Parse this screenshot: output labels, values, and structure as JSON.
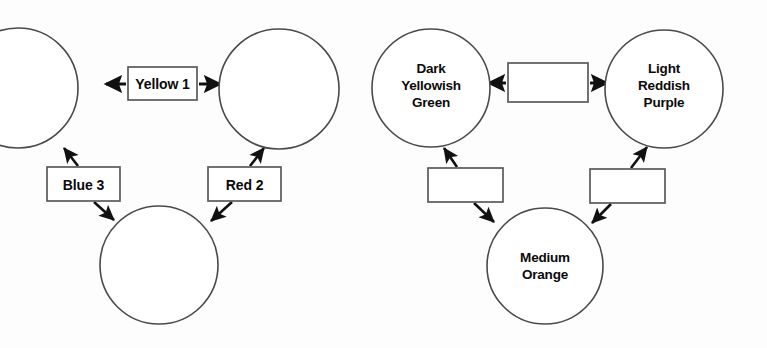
{
  "diagram": {
    "background_color": "#fdfdfd",
    "stroke_color": "#111111",
    "shape_outline_color": "#4a4a4a",
    "text_color": "#0a0a0a",
    "groups": [
      {
        "id": "left-group",
        "description": "Three empty circles connected by three labeled rectangles",
        "circles": [
          {
            "id": "left-top-left-circle",
            "label": "",
            "cx": 18,
            "cy": 88,
            "r": 60,
            "clipped": true
          },
          {
            "id": "left-top-right-circle",
            "label": "",
            "cx": 279,
            "cy": 89,
            "r": 60,
            "clipped": false
          },
          {
            "id": "left-bottom-circle",
            "label": "",
            "cx": 159,
            "cy": 265,
            "r": 59,
            "clipped": false
          }
        ],
        "boxes": [
          {
            "id": "yellow-1-box",
            "label": "Yellow 1",
            "x": 128,
            "y": 67,
            "w": 69,
            "h": 33
          },
          {
            "id": "blue-3-box",
            "label": "Blue 3",
            "x": 47,
            "y": 167,
            "w": 73,
            "h": 34
          },
          {
            "id": "red-2-box",
            "label": "Red 2",
            "x": 208,
            "y": 167,
            "w": 73,
            "h": 34
          }
        ],
        "connections": [
          {
            "from": "yellow-1-box",
            "to": "left-top-left-circle",
            "arrow": "to-circle"
          },
          {
            "from": "yellow-1-box",
            "to": "left-top-right-circle",
            "arrow": "to-circle"
          },
          {
            "from": "blue-3-box",
            "to": "left-top-left-circle",
            "arrow": "to-circle"
          },
          {
            "from": "blue-3-box",
            "to": "left-bottom-circle",
            "arrow": "to-circle"
          },
          {
            "from": "red-2-box",
            "to": "left-top-right-circle",
            "arrow": "to-circle"
          },
          {
            "from": "red-2-box",
            "to": "left-bottom-circle",
            "arrow": "to-circle"
          }
        ]
      },
      {
        "id": "right-group",
        "description": "Three labeled circles connected by three empty rectangles",
        "circles": [
          {
            "id": "dark-yellowish-green-circle",
            "label_lines": [
              "Dark",
              "Yellowish",
              "Green"
            ],
            "cx": 431,
            "cy": 88,
            "r": 59,
            "clipped": false
          },
          {
            "id": "light-reddish-purple-circle",
            "label_lines": [
              "Light",
              "Reddish",
              "Purple"
            ],
            "cx": 664,
            "cy": 89,
            "r": 59,
            "clipped": false
          },
          {
            "id": "medium-orange-circle",
            "label_lines": [
              "Medium",
              "Orange"
            ],
            "cx": 545,
            "cy": 266,
            "r": 58,
            "clipped": false
          }
        ],
        "boxes": [
          {
            "id": "right-top-empty-box",
            "label": "",
            "x": 508,
            "y": 63,
            "w": 80,
            "h": 39
          },
          {
            "id": "right-lower-left-empty-box",
            "label": "",
            "x": 428,
            "y": 168,
            "w": 75,
            "h": 34
          },
          {
            "id": "right-lower-right-empty-box",
            "label": "",
            "x": 590,
            "y": 169,
            "w": 75,
            "h": 34
          }
        ],
        "connections": [
          {
            "from": "right-top-empty-box",
            "to": "dark-yellowish-green-circle",
            "arrow": "to-circle"
          },
          {
            "from": "right-top-empty-box",
            "to": "light-reddish-purple-circle",
            "arrow": "to-circle"
          },
          {
            "from": "right-lower-left-empty-box",
            "to": "dark-yellowish-green-circle",
            "arrow": "to-circle"
          },
          {
            "from": "right-lower-left-empty-box",
            "to": "medium-orange-circle",
            "arrow": "to-circle"
          },
          {
            "from": "right-lower-right-empty-box",
            "to": "light-reddish-purple-circle",
            "arrow": "to-circle"
          },
          {
            "from": "right-lower-right-empty-box",
            "to": "medium-orange-circle",
            "arrow": "to-circle"
          }
        ]
      }
    ]
  }
}
